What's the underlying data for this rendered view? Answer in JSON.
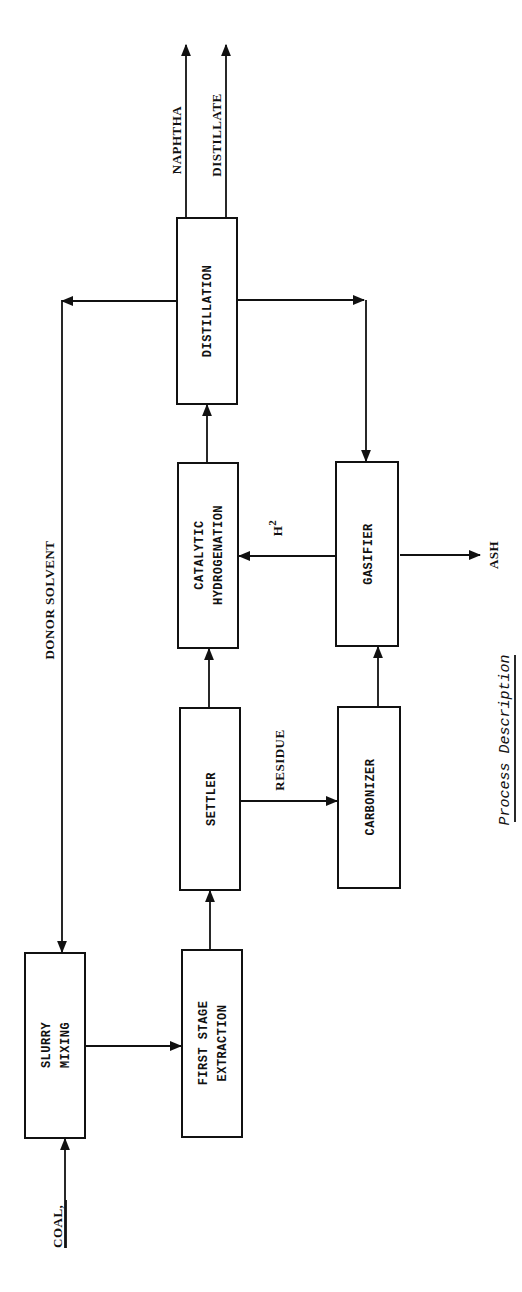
{
  "diagram": {
    "caption": "Process Description",
    "units": {
      "slurry_mixing": {
        "line1": "SLURRY",
        "line2": "MIXING"
      },
      "first_stage_extraction": {
        "line1": "FIRST STAGE",
        "line2": "EXTRACTION"
      },
      "settler": {
        "line1": "SETTLER"
      },
      "carbonizer": {
        "line1": "CARBONIZER"
      },
      "catalytic_hydrogenation": {
        "line1": "CATALYTIC",
        "line2": "HYDROGENATION"
      },
      "gasifier": {
        "line1": "GASIFIER"
      },
      "distillation": {
        "line1": "DISTILLATION"
      }
    },
    "streams": {
      "coal": "COAL,",
      "donor_solvent": "DONOR  SOLVENT",
      "residue": "RESIDUE",
      "h2": "H",
      "h2_sub": "2",
      "ash": "ASH",
      "naphtha": "NAPHTHA",
      "distillate": "DISTILLATE"
    },
    "colors": {
      "ink": "#111111",
      "background": "#ffffff"
    }
  }
}
